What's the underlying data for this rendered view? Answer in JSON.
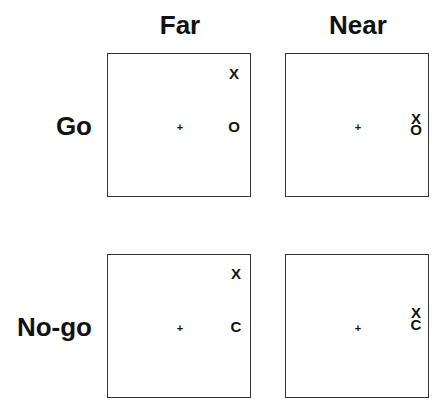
{
  "columns": [
    {
      "label": "Far"
    },
    {
      "label": "Near"
    }
  ],
  "rows": [
    {
      "label": "Go"
    },
    {
      "label": "No-go"
    }
  ],
  "panels": {
    "go_far": {
      "fixation": "+",
      "top_symbol": "X",
      "bottom_symbol": "O"
    },
    "go_near": {
      "fixation": "+",
      "top_symbol": "X",
      "bottom_symbol": "O"
    },
    "nogo_far": {
      "fixation": "+",
      "top_symbol": "X",
      "bottom_symbol": "C"
    },
    "nogo_near": {
      "fixation": "+",
      "top_symbol": "X",
      "bottom_symbol": "C"
    }
  },
  "colors": {
    "border": "#333333",
    "text": "#111111",
    "background": "#ffffff"
  }
}
